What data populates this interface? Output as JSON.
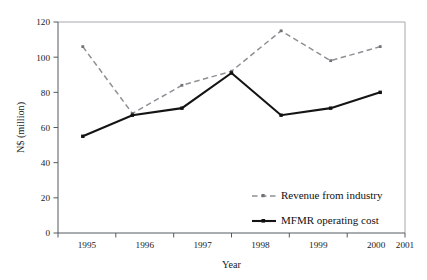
{
  "chart_data": {
    "type": "line",
    "title": "",
    "xlabel": "Year",
    "ylabel": "N$ (million)",
    "categories": [
      "1995",
      "1996",
      "1997",
      "1998",
      "1999",
      "2000",
      "2001"
    ],
    "x": [
      1995,
      1996,
      1997,
      1998,
      1999,
      2000,
      2001
    ],
    "series": [
      {
        "name": "Revenue from industry",
        "style": "dashed",
        "color": "#8d9094",
        "marker": "square",
        "values": [
          106,
          68,
          84,
          92,
          115,
          98,
          106
        ]
      },
      {
        "name": "MFMR operating cost",
        "style": "solid",
        "color": "#141414",
        "marker": "square",
        "values": [
          55,
          67,
          71,
          91,
          67,
          71,
          80
        ]
      }
    ],
    "ylim": [
      0,
      120
    ],
    "yticks": [
      0,
      20,
      40,
      60,
      80,
      100,
      120
    ],
    "ytick_labels": [
      "0",
      "20",
      "40",
      "60",
      "80",
      "100",
      "120"
    ],
    "grid": false,
    "legend_position": "inside-lower-right"
  },
  "axes": {
    "y_title": "N$ (million)",
    "x_title": "Year"
  },
  "legend": {
    "entries": [
      {
        "label": "Revenue from industry"
      },
      {
        "label": "MFMR operating cost"
      }
    ]
  },
  "colors": {
    "revenue_series": "#8d9094",
    "cost_series": "#141414",
    "axis": "#555a5e",
    "frame": "#9a9ea2",
    "background": "#ffffff"
  }
}
